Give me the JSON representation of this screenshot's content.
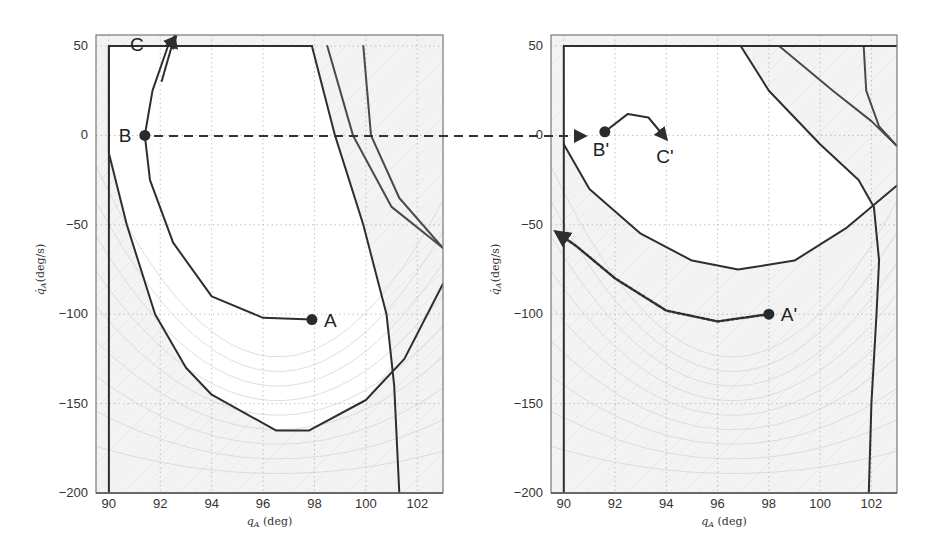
{
  "chart_data": [
    {
      "type": "line",
      "title": "",
      "xlabel": "q_A (deg)",
      "ylabel": "q̇_A (deg/s)",
      "xlim": [
        89.5,
        103
      ],
      "ylim": [
        -200,
        55
      ],
      "xticks": [
        90,
        92,
        94,
        96,
        98,
        100,
        102
      ],
      "yticks": [
        50,
        0,
        -50,
        -100,
        -150,
        -200
      ],
      "grid": true,
      "shaded_region": "outside viable set (light gray with faint vector-field arrows)",
      "series": [
        {
          "name": "trajectory A-B-C",
          "style": "solid-arrow",
          "points": [
            [
              97.9,
              -103
            ],
            [
              96,
              -102
            ],
            [
              94,
              -90
            ],
            [
              92.5,
              -60
            ],
            [
              91.6,
              -25
            ],
            [
              91.4,
              0
            ],
            [
              91.7,
              25
            ],
            [
              92.3,
              50
            ],
            [
              92.6,
              55
            ]
          ]
        },
        {
          "name": "viability boundary (inner)",
          "style": "solid",
          "points": [
            [
              90.0,
              50
            ],
            [
              90.0,
              -10
            ],
            [
              90.7,
              -50
            ],
            [
              91.8,
              -100
            ],
            [
              93.0,
              -130
            ],
            [
              94.0,
              -145
            ],
            [
              96.5,
              -165
            ],
            [
              97.8,
              -165
            ],
            [
              100,
              -148
            ],
            [
              101.5,
              -125
            ],
            [
              103,
              -83
            ]
          ]
        },
        {
          "name": "vertical boundary left",
          "style": "solid",
          "points": [
            [
              90,
              50
            ],
            [
              90,
              -200
            ]
          ]
        },
        {
          "name": "upper velocity limit",
          "style": "solid",
          "points": [
            [
              90,
              50
            ],
            [
              97.9,
              50
            ]
          ]
        },
        {
          "name": "falling boundary 1",
          "style": "solid",
          "points": [
            [
              97.9,
              50
            ],
            [
              98.8,
              0
            ],
            [
              99.9,
              -50
            ],
            [
              100.8,
              -100
            ],
            [
              101.1,
              -140
            ],
            [
              101.3,
              -200
            ]
          ]
        },
        {
          "name": "falling boundary 2",
          "style": "solid",
          "points": [
            [
              98.5,
              50
            ],
            [
              99.5,
              0
            ],
            [
              101,
              -40
            ],
            [
              103,
              -63
            ]
          ]
        },
        {
          "name": "falling boundary 3",
          "style": "solid",
          "points": [
            [
              99.9,
              50
            ],
            [
              100.2,
              0
            ],
            [
              101.3,
              -35
            ],
            [
              103,
              -63
            ]
          ]
        }
      ],
      "annotations": [
        {
          "label": "A",
          "x": 97.9,
          "y": -103,
          "marker": "dot"
        },
        {
          "label": "B",
          "x": 91.4,
          "y": 0,
          "marker": "dot"
        },
        {
          "label": "C",
          "x": 92.3,
          "y": 45,
          "marker": "arrow"
        }
      ]
    },
    {
      "type": "line",
      "title": "",
      "xlabel": "q_A (deg)",
      "ylabel": "q̇_A (deg/s)",
      "xlim": [
        89.5,
        103
      ],
      "ylim": [
        -200,
        55
      ],
      "xticks": [
        90,
        92,
        94,
        96,
        98,
        100,
        102
      ],
      "yticks": [
        50,
        0,
        -50,
        -100,
        -150,
        -200
      ],
      "grid": true,
      "series": [
        {
          "name": "trajectory B'-C'",
          "style": "solid-arrow",
          "points": [
            [
              91.6,
              2
            ],
            [
              92.5,
              12
            ],
            [
              93.3,
              10
            ],
            [
              94.0,
              -2
            ]
          ]
        },
        {
          "name": "trajectory A' (dotted)",
          "style": "dotted-arrow",
          "points": [
            [
              98,
              -100
            ],
            [
              96,
              -104
            ],
            [
              94,
              -98
            ],
            [
              92,
              -80
            ],
            [
              90.5,
              -62
            ],
            [
              89.7,
              -54
            ]
          ]
        },
        {
          "name": "bowl boundary",
          "style": "solid",
          "points": [
            [
              90,
              -5
            ],
            [
              91,
              -30
            ],
            [
              93,
              -55
            ],
            [
              95,
              -70
            ],
            [
              96.8,
              -75
            ],
            [
              99,
              -70
            ],
            [
              101,
              -52
            ],
            [
              102,
              -40
            ],
            [
              103,
              -28
            ]
          ]
        },
        {
          "name": "diagonal boundary 1",
          "style": "solid",
          "points": [
            [
              96.9,
              50
            ],
            [
              98,
              25
            ],
            [
              100,
              -5
            ],
            [
              101.5,
              -25
            ],
            [
              102.1,
              -40
            ],
            [
              102.3,
              -70
            ],
            [
              102.2,
              -100
            ],
            [
              102.0,
              -150
            ],
            [
              101.9,
              -200
            ]
          ]
        },
        {
          "name": "diagonal boundary 2",
          "style": "solid",
          "points": [
            [
              98.4,
              50
            ],
            [
              100.5,
              25
            ],
            [
              102,
              8
            ],
            [
              103,
              -6
            ]
          ]
        },
        {
          "name": "right curve",
          "style": "solid",
          "points": [
            [
              101.7,
              50
            ],
            [
              101.8,
              25
            ],
            [
              102.3,
              5
            ],
            [
              103,
              -6
            ]
          ]
        },
        {
          "name": "vertical boundary left",
          "style": "solid",
          "points": [
            [
              90,
              50
            ],
            [
              90,
              -200
            ]
          ]
        },
        {
          "name": "upper velocity limit",
          "style": "solid",
          "points": [
            [
              90,
              50
            ],
            [
              103,
              50
            ]
          ]
        }
      ],
      "annotations": [
        {
          "label": "A'",
          "x": 98,
          "y": -100,
          "marker": "dot"
        },
        {
          "label": "B'",
          "x": 91.6,
          "y": 2,
          "marker": "dot"
        },
        {
          "label": "C'",
          "x": 94.0,
          "y": -2,
          "marker": "arrow"
        }
      ]
    }
  ],
  "connector": {
    "from": "B",
    "to": "B'",
    "style": "dashed-arrow"
  },
  "plots": {
    "left": {
      "xticks": [
        "90",
        "92",
        "94",
        "96",
        "98",
        "100",
        "102"
      ],
      "yticks": [
        "50",
        "0",
        "-50",
        "-100",
        "-150",
        "-200"
      ],
      "xlabel": "q_A (deg)",
      "ylabel": "q̇_A (deg/s)",
      "labels": {
        "A": "A",
        "B": "B",
        "C": "C"
      }
    },
    "right": {
      "xticks": [
        "90",
        "92",
        "94",
        "96",
        "98",
        "100",
        "102"
      ],
      "yticks": [
        "50",
        "0",
        "-50",
        "-100",
        "-150",
        "-200"
      ],
      "xlabel": "q_A (deg)",
      "ylabel": "q̇_A (deg/s)",
      "labels": {
        "A": "A'",
        "B": "B'",
        "C": "C'"
      }
    }
  },
  "colors": {
    "curve": "#2e2e2e",
    "grid": "#b8b8b8",
    "shade": "#f2f2f2",
    "frame": "#777777"
  }
}
